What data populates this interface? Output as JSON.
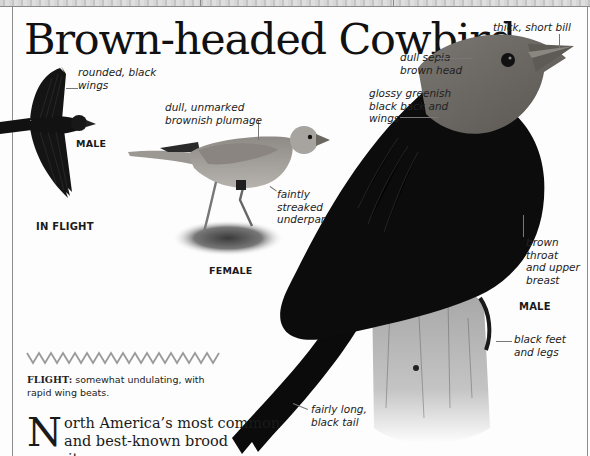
{
  "page": {
    "title": "Brown-headed Cowbird"
  },
  "flight_figure": {
    "caption": "IN FLIGHT",
    "sex_label": "MALE",
    "annotations": [
      {
        "id": "wings",
        "lines": [
          "rounded, black",
          "wings"
        ]
      }
    ]
  },
  "female_figure": {
    "caption": "FEMALE",
    "annotations": [
      {
        "id": "plumage",
        "lines": [
          "dull, unmarked",
          "brownish plumage"
        ]
      },
      {
        "id": "underparts",
        "lines": [
          "faintly",
          "streaked",
          "underparts"
        ]
      }
    ]
  },
  "male_figure": {
    "caption": "MALE",
    "annotations": [
      {
        "id": "bill",
        "lines": [
          "thick, short bill"
        ]
      },
      {
        "id": "head",
        "lines": [
          "dull sepia-",
          "brown head"
        ]
      },
      {
        "id": "back",
        "lines": [
          "glossy greenish",
          "black back and",
          "wings"
        ]
      },
      {
        "id": "throat",
        "lines": [
          "brown",
          "throat",
          "and upper",
          "breast"
        ]
      },
      {
        "id": "feet",
        "lines": [
          "black feet",
          "and legs"
        ]
      },
      {
        "id": "tail",
        "lines": [
          "fairly long,",
          "black tail"
        ]
      }
    ]
  },
  "flight_pattern": {
    "label": "FLIGHT:",
    "description": " somewhat undulating, with rapid wing beats."
  },
  "body": {
    "dropcap": "N",
    "text_line1": "orth America’s most common",
    "text_line2": "and best-known brood parasite,"
  },
  "colors": {
    "paper": "#fdfdfd",
    "border": "#8c8c8c",
    "zigzag": "#9a9a9a",
    "male_body": "#0c0c0c",
    "male_head": "#6e6a66",
    "female_body": "#a19d98"
  }
}
